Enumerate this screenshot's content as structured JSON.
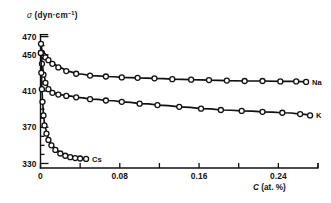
{
  "chart_data": {
    "type": "line",
    "title": "",
    "subtitle": "",
    "ylabel": "σ (dyn·cm⁻¹)",
    "ylabel_symbol": "σ",
    "ylabel_unit": "(dyn·cm",
    "ylabel_unit_sup": "−1",
    "ylabel_unit_close": ")",
    "xlabel": "C (at. %)",
    "xlabel_symbol": "C",
    "xlabel_unit": "(at. %)",
    "xlim": [
      0,
      0.28
    ],
    "ylim": [
      325,
      474
    ],
    "grid": false,
    "legend_position": "right-of-curve-ends",
    "y_ticks": [
      330,
      370,
      410,
      450,
      470
    ],
    "y_tick_labels": [
      "330",
      "370",
      "410",
      "450",
      "470"
    ],
    "y_minor_ticks": [
      340,
      350,
      360,
      380,
      390,
      400,
      420,
      430,
      440,
      460
    ],
    "x_ticks": [
      0,
      0.04,
      0.08,
      0.12,
      0.16,
      0.2,
      0.24,
      0.28
    ],
    "x_tick_labels": [
      "0",
      "",
      "0.08",
      "",
      "0.16",
      "",
      "0.24",
      ""
    ],
    "x_labeled_ticks": [
      {
        "value": 0,
        "label": "0"
      },
      {
        "value": 0.08,
        "label": "0.08"
      },
      {
        "value": 0.16,
        "label": "0.16"
      },
      {
        "value": 0.24,
        "label": "0.24"
      }
    ],
    "marker": "open-circle",
    "series": [
      {
        "name": "Na",
        "label": "Na",
        "color": "#111111",
        "x": [
          0.0005,
          0.0015,
          0.003,
          0.005,
          0.008,
          0.012,
          0.018,
          0.026,
          0.036,
          0.05,
          0.066,
          0.082,
          0.098,
          0.115,
          0.133,
          0.152,
          0.17,
          0.188,
          0.206,
          0.224,
          0.242,
          0.258,
          0.268
        ],
        "y": [
          462,
          452,
          449,
          447,
          444,
          440,
          436,
          432,
          429,
          427,
          426,
          425,
          424.5,
          424,
          423,
          422.5,
          422,
          421.5,
          421,
          421,
          420.5,
          420.5,
          420
        ]
      },
      {
        "name": "K",
        "label": "K",
        "color": "#111111",
        "x": [
          0.0005,
          0.0015,
          0.003,
          0.005,
          0.008,
          0.012,
          0.018,
          0.026,
          0.036,
          0.05,
          0.066,
          0.082,
          0.1,
          0.118,
          0.14,
          0.162,
          0.182,
          0.203,
          0.224,
          0.244,
          0.262,
          0.272
        ],
        "y": [
          452,
          440,
          428,
          419,
          412,
          408,
          406,
          404.5,
          403,
          401,
          399.5,
          398,
          396,
          394.5,
          392.5,
          390.5,
          389,
          388,
          387,
          386,
          384.5,
          383
        ]
      },
      {
        "name": "Cs",
        "label": "Cs",
        "color": "#111111",
        "x": [
          0.0003,
          0.0008,
          0.0014,
          0.002,
          0.003,
          0.004,
          0.006,
          0.008,
          0.011,
          0.015,
          0.02,
          0.025,
          0.03,
          0.035,
          0.04,
          0.046
        ],
        "y": [
          452,
          430,
          412,
          398,
          383,
          372,
          363,
          356,
          350,
          345,
          341,
          338.5,
          337,
          336,
          335.5,
          335
        ]
      }
    ]
  }
}
